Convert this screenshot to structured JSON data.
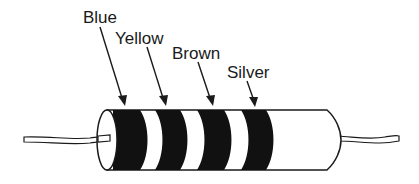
{
  "diagram": {
    "bands": [
      {
        "label": "Blue"
      },
      {
        "label": "Yellow"
      },
      {
        "label": "Brown"
      },
      {
        "label": "Silver"
      }
    ],
    "colors": {
      "ink": "#1a1a1a",
      "background": "#ffffff"
    }
  }
}
